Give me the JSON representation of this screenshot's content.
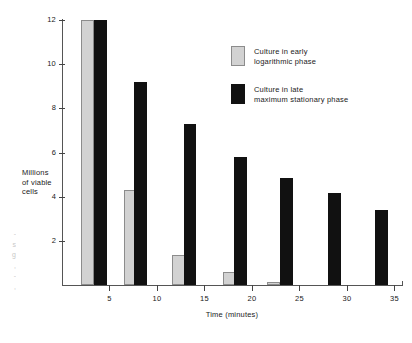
{
  "chart_data": {
    "type": "bar",
    "title": "",
    "subtitle": "",
    "xlabel": "Time (minutes)",
    "ylabel": "Millions of viable cells",
    "ylabel_lines": [
      "Millions",
      "of viable",
      "cells"
    ],
    "xlim": [
      0,
      35.8
    ],
    "ylim": [
      0,
      12.3
    ],
    "grid": false,
    "legend_position": "upper-right-inside",
    "x_ticks": [
      5,
      10,
      15,
      20,
      25,
      30,
      35
    ],
    "x_tick_labels": [
      "5",
      "10",
      "15",
      "20",
      "25",
      "30",
      "35"
    ],
    "y_ticks": [
      2,
      4,
      6,
      8,
      10,
      12
    ],
    "y_tick_labels": [
      "2",
      "4",
      "6",
      "8",
      "10",
      "12"
    ],
    "series": [
      {
        "name": "Culture in early logarithmic phase",
        "name_lines": [
          "Culture in early",
          "logarithmic phase"
        ],
        "color": "#d2d2d2",
        "edge_color": "#8c8c8c",
        "points": [
          {
            "x": 2.0,
            "y": 12.0
          },
          {
            "x": 6.5,
            "y": 4.3
          },
          {
            "x": 11.6,
            "y": 1.35
          },
          {
            "x": 17.0,
            "y": 0.6
          },
          {
            "x": 21.6,
            "y": 0.15
          }
        ]
      },
      {
        "name": "Culture in late maximum stationary phase",
        "name_lines": [
          "Culture in late",
          "maximum stationary phase"
        ],
        "color": "#111111",
        "edge_color": "#111111",
        "points": [
          {
            "x": 3.4,
            "y": 12.0
          },
          {
            "x": 7.6,
            "y": 9.2
          },
          {
            "x": 12.8,
            "y": 7.3
          },
          {
            "x": 18.1,
            "y": 5.8
          },
          {
            "x": 23.0,
            "y": 4.85
          },
          {
            "x": 28.0,
            "y": 4.15
          },
          {
            "x": 33.0,
            "y": 3.4
          }
        ]
      }
    ],
    "bar_width_minutes": 1.35
  },
  "legend": {
    "entries": [
      {
        "line1": "Culture in early",
        "line2": "logarithmic phase",
        "swatch": "gray"
      },
      {
        "line1": "Culture in late",
        "line2": "maximum stationary phase",
        "swatch": "black"
      }
    ]
  },
  "axes": {
    "y_title_line1": "Millions",
    "y_title_line2": "of viable",
    "y_title_line3": "cells",
    "x_title": "Time (minutes)"
  },
  "margin_note": {
    "lines": [
      "-",
      "s",
      "g",
      ",",
      "-",
      ","
    ]
  }
}
